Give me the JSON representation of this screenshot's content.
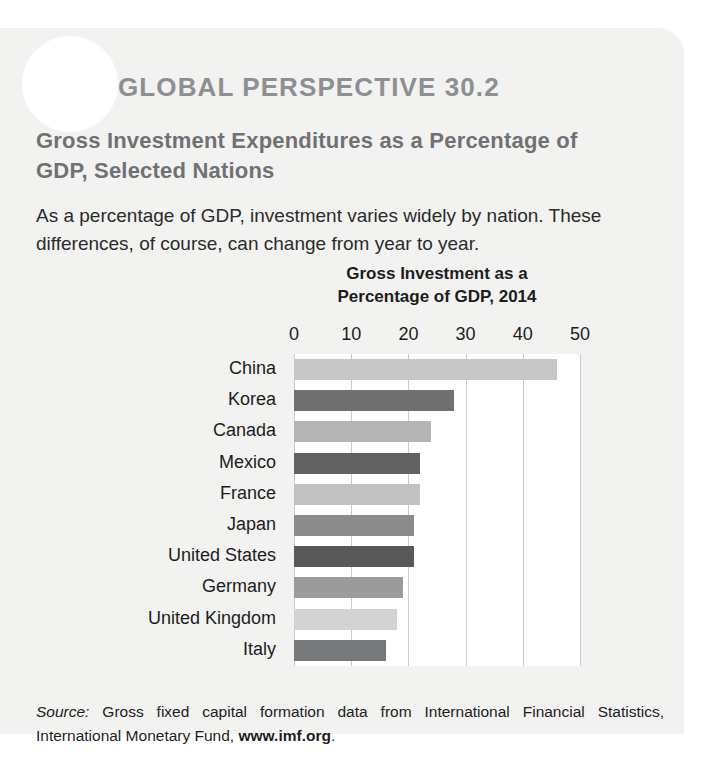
{
  "badge": {
    "icon": "globe-icon",
    "label": "GLOBAL PERSPECTIVE 30.2"
  },
  "headline": "Gross Investment Expenditures as a Percentage of GDP, Selected Nations",
  "lede": "As a percentage of GDP, investment varies widely by nation. These differences, of course, can change from year to year.",
  "source": {
    "label": "Source:",
    "text": " Gross fixed capital formation data from International Financial Statistics, International Monetary Fund, ",
    "url": "www.imf.org",
    "period": "."
  },
  "colors": {
    "panel_background": "#f2f2f1",
    "plot_background": "#ffffff",
    "gridline": "#c9cbcc",
    "badge_text": "#8d8f91",
    "headline_text": "#6f7173",
    "body_text": "#1d1d1d"
  },
  "chart_data": {
    "type": "bar",
    "orientation": "horizontal",
    "title": "Gross Investment as a Percentage of GDP, 2014",
    "title_line1": "Gross Investment as a",
    "title_line2": "Percentage of GDP, 2014",
    "xlabel": "",
    "ylabel": "",
    "xlim": [
      0,
      50
    ],
    "xticks": [
      0,
      10,
      20,
      30,
      40,
      50
    ],
    "tick_labels": [
      "0",
      "10",
      "20",
      "30",
      "40",
      "50"
    ],
    "grid": true,
    "legend": false,
    "categories": [
      "China",
      "Korea",
      "Canada",
      "Mexico",
      "France",
      "Japan",
      "United States",
      "Germany",
      "United Kingdom",
      "Italy"
    ],
    "values": [
      46,
      28,
      24,
      22,
      22,
      21,
      21,
      19,
      18,
      16
    ],
    "bar_colors": [
      "#c7c7c5",
      "#6f7072",
      "#b3b4b4",
      "#616264",
      "#c0c1c0",
      "#8a8b8c",
      "#58595b",
      "#9a9b9c",
      "#d2d3d2",
      "#77787a"
    ]
  }
}
